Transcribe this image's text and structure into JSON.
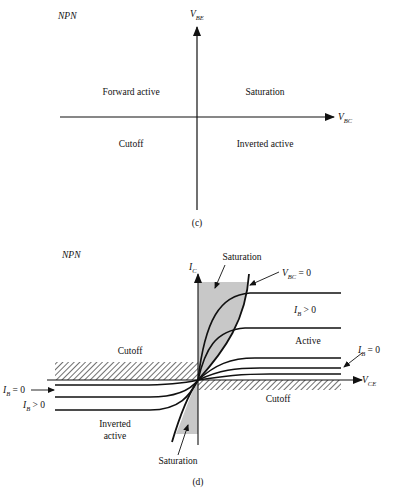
{
  "diagram_c": {
    "device_label": "NPN",
    "y_axis": {
      "symbol": "V",
      "subscript": "BE"
    },
    "x_axis": {
      "symbol": "V",
      "subscript": "BC"
    },
    "regions": {
      "top_left": "Forward active",
      "top_right": "Saturation",
      "bottom_left": "Cutoff",
      "bottom_right": "Inverted active"
    },
    "caption": "(c)"
  },
  "diagram_d": {
    "device_label": "NPN",
    "y_axis": {
      "symbol": "I",
      "subscript": "C"
    },
    "x_axis": {
      "symbol": "V",
      "subscript": "CE"
    },
    "labels": {
      "saturation_top": "Saturation",
      "vbc_zero": {
        "symbol": "V",
        "subscript": "BC",
        "rest": " = 0"
      },
      "ib_gt0_right": {
        "symbol": "I",
        "subscript": "B",
        "rest": " > 0"
      },
      "active": "Active",
      "ib_eq0_right": {
        "symbol": "I",
        "subscript": "B",
        "rest": " = 0"
      },
      "cutoff_left": "Cutoff",
      "cutoff_right": "Cutoff",
      "ib_eq0_left": {
        "symbol": "I",
        "subscript": "B",
        "rest": " = 0"
      },
      "ib_gt0_left": {
        "symbol": "I",
        "subscript": "B",
        "rest": " > 0"
      },
      "inverted_line1": "Inverted",
      "inverted_line2": "active",
      "saturation_bottom": "Saturation"
    },
    "caption": "(d)"
  }
}
